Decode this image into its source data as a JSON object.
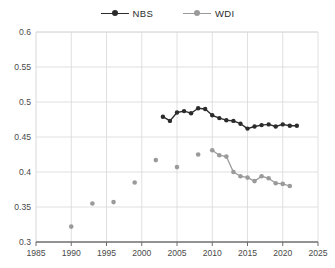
{
  "legend": {
    "position": "top-center",
    "entries": [
      {
        "label": "NBS",
        "color": "#2b2b2b",
        "marker": "circle"
      },
      {
        "label": "WDI",
        "color": "#9a9a9a",
        "marker": "circle"
      }
    ]
  },
  "chart_data": {
    "type": "line",
    "title": "",
    "subtitle": "",
    "xlabel": "",
    "ylabel": "",
    "xlim": [
      1985,
      2025
    ],
    "ylim": [
      0.3,
      0.6
    ],
    "grid": true,
    "xticks": [
      1985,
      1990,
      1995,
      2000,
      2005,
      2010,
      2015,
      2020,
      2025
    ],
    "xtick_labels": [
      "1985",
      "1990",
      "1995",
      "2000",
      "2005",
      "2010",
      "2015",
      "2020",
      "2025"
    ],
    "yticks": [
      0.3,
      0.35,
      0.4,
      0.45,
      0.5,
      0.55,
      0.6
    ],
    "ytick_labels": [
      "0.3",
      "0.35",
      "0.4",
      "0.45",
      "0.5",
      "0.55",
      "0.6"
    ],
    "series": [
      {
        "name": "NBS",
        "color": "#2b2b2b",
        "style": "line-markers",
        "x": [
          2003,
          2004,
          2005,
          2006,
          2007,
          2008,
          2009,
          2010,
          2011,
          2012,
          2013,
          2014,
          2015,
          2016,
          2017,
          2018,
          2019,
          2020,
          2021,
          2022
        ],
        "y": [
          0.479,
          0.473,
          0.485,
          0.487,
          0.484,
          0.491,
          0.49,
          0.481,
          0.477,
          0.474,
          0.473,
          0.469,
          0.462,
          0.465,
          0.467,
          0.468,
          0.465,
          0.468,
          0.466,
          0.466
        ]
      },
      {
        "name": "WDI",
        "color": "#9a9a9a",
        "style": "markers-then-line",
        "x": [
          1990,
          1993,
          1996,
          1999,
          2002,
          2005,
          2008,
          2010,
          2011,
          2012,
          2013,
          2014,
          2015,
          2016,
          2017,
          2018,
          2019,
          2020,
          2021
        ],
        "y": [
          0.322,
          0.355,
          0.357,
          0.385,
          0.417,
          0.407,
          0.425,
          0.431,
          0.424,
          0.422,
          0.4,
          0.394,
          0.392,
          0.387,
          0.394,
          0.391,
          0.384,
          0.383,
          0.38
        ]
      }
    ]
  },
  "colors": {
    "nbs": "#2b2b2b",
    "wdi": "#9a9a9a",
    "grid": "#d8d8d8",
    "axis": "#808080",
    "text": "#4a4a4a"
  }
}
